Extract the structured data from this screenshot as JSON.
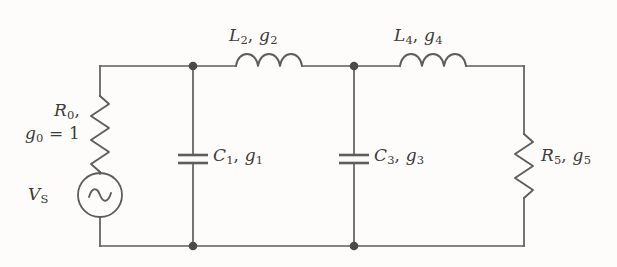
{
  "figure": {
    "kind": "circuit-schematic",
    "line_color": "#5d5d5d",
    "background_color": "#fdfcfb",
    "text_color": "#3c3b3a"
  },
  "labels": {
    "source_resistor": {
      "line1_symbol": "R",
      "line1_sub": "0",
      "line1_suffix": ",",
      "line2_symbol": "g",
      "line2_sub": "0",
      "line2_suffix": " = 1"
    },
    "source_voltage": {
      "symbol": "V",
      "sub": "S"
    },
    "inductor_2": {
      "symbol_1": "L",
      "sub_1": "2",
      "separator": ", ",
      "symbol_2": "g",
      "sub_2": "2"
    },
    "inductor_4": {
      "symbol_1": "L",
      "sub_1": "4",
      "separator": ", ",
      "symbol_2": "g",
      "sub_2": "4"
    },
    "capacitor_1": {
      "symbol_1": "C",
      "sub_1": "1",
      "separator": ", ",
      "symbol_2": "g",
      "sub_2": "1"
    },
    "capacitor_3": {
      "symbol_1": "C",
      "sub_1": "3",
      "separator": ", ",
      "symbol_2": "g",
      "sub_2": "3"
    },
    "resistor_5": {
      "symbol_1": "R",
      "sub_1": "5",
      "separator": ", ",
      "symbol_2": "g",
      "sub_2": "5"
    }
  },
  "geometry": {
    "top_rail_y": 66,
    "bottom_rail_y": 246,
    "left_branch_x": 100,
    "node1_x": 193,
    "node2_x": 354,
    "right_branch_x": 524,
    "source_center_y": 195,
    "source_radius": 22,
    "capacitor_plate_top_y": 155,
    "capacitor_plate_bottom_y": 163,
    "capacitor_plate_half_width": 15,
    "node_dot_radius": 4.3
  }
}
